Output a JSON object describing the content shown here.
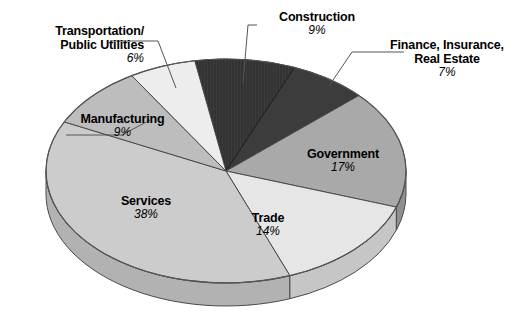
{
  "chart_data": {
    "type": "pie",
    "title": "",
    "subtitle": "",
    "xlabel": "",
    "ylabel": "",
    "legend_position": "none",
    "grid": false,
    "unit": "%",
    "total": 100,
    "categories": [
      "Construction",
      "Finance, Insurance, Real Estate",
      "Government",
      "Trade",
      "Services",
      "Manufacturing",
      "Transportation/Public Utilities"
    ],
    "values": [
      9,
      7,
      17,
      14,
      38,
      9,
      6
    ],
    "colors": [
      "#333333",
      "#3c3c3c",
      "#a9a9a9",
      "#e6e6e6",
      "#cccccc",
      "#bdbdbd",
      "#ededed"
    ],
    "slices": [
      {
        "id": "construction",
        "label": "Construction",
        "label_lines": [
          "Construction"
        ],
        "percent_text": "9%",
        "value": 9,
        "color": "#333333",
        "side_color": "#2a2a2a",
        "leader": true
      },
      {
        "id": "finance-insurance-real-estate",
        "label": "Finance, Insurance, Real Estate",
        "label_lines": [
          "Finance, Insurance,",
          "Real Estate"
        ],
        "percent_text": "7%",
        "value": 7,
        "color": "#3c3c3c",
        "side_color": "#303030",
        "leader": true
      },
      {
        "id": "government",
        "label": "Government",
        "label_lines": [
          "Government"
        ],
        "percent_text": "17%",
        "value": 17,
        "color": "#a9a9a9",
        "side_color": "#8f8f8f",
        "leader": false
      },
      {
        "id": "trade",
        "label": "Trade",
        "label_lines": [
          "Trade"
        ],
        "percent_text": "14%",
        "value": 14,
        "color": "#e6e6e6",
        "side_color": "#c6c6c6",
        "leader": false
      },
      {
        "id": "services",
        "label": "Services",
        "label_lines": [
          "Services"
        ],
        "percent_text": "38%",
        "value": 38,
        "color": "#cccccc",
        "side_color": "#b2b2b2",
        "leader": false
      },
      {
        "id": "manufacturing",
        "label": "Manufacturing",
        "label_lines": [
          "Manufacturing"
        ],
        "percent_text": "9%",
        "value": 9,
        "color": "#bdbdbd",
        "side_color": "#a3a3a3",
        "leader": true
      },
      {
        "id": "transportation-public-utilities",
        "label": "Transportation/Public Utilities",
        "label_lines": [
          "Transportation/",
          "Public Utilities"
        ],
        "percent_text": "6%",
        "value": 6,
        "color": "#ededed",
        "side_color": "#cfcfcf",
        "leader": true
      }
    ]
  },
  "labels": {
    "transportation_l1": "Transportation/",
    "transportation_l2": "Public Utilities",
    "transportation_pct": "6%",
    "manufacturing_l1": "Manufacturing",
    "manufacturing_pct": "9%",
    "services_l1": "Services",
    "services_pct": "38%",
    "trade_l1": "Trade",
    "trade_pct": "14%",
    "government_l1": "Government",
    "government_pct": "17%",
    "construction_l1": "Construction",
    "construction_pct": "9%",
    "finance_l1": "Finance, Insurance,",
    "finance_l2": "Real Estate",
    "finance_pct": "7%"
  }
}
